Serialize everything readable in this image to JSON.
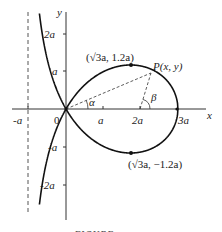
{
  "figure": {
    "type": "strophoid curve plot",
    "equation_note": "y^2 = x^2 (3a - x) / (a + x)",
    "axes": {
      "x_label": "x",
      "y_label": "y",
      "origin_label": "0",
      "x_ticks": [
        "-a",
        "a",
        "2a",
        "3a"
      ],
      "y_ticks": [
        "2a",
        "a",
        "-a",
        "-2a"
      ]
    },
    "asymptote": {
      "x": "-a",
      "style": "dashed"
    },
    "points": {
      "upper": "(√3a, 1.2a)",
      "lower": "(√3a, −1.2a)",
      "moving": "P(x, y)"
    },
    "angles": {
      "alpha": "α",
      "beta": "β"
    },
    "caption": "FIGURE"
  },
  "colors": {
    "ink": "#222222",
    "background": "#ffffff"
  }
}
